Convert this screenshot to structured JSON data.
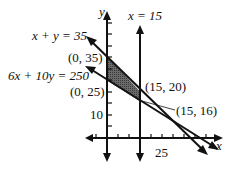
{
  "diagram": {
    "type": "linear-programming-feasible-region",
    "axes": {
      "x_label": "x",
      "y_label": "y",
      "x_tick_label": "25",
      "y_tick_label": "10"
    },
    "lines": [
      {
        "equation": "x + y = 35",
        "label": "x + y = 35"
      },
      {
        "equation": "6x + 10y = 250",
        "label": "6x + 10y = 250"
      },
      {
        "equation": "x = 15",
        "label": "x = 15"
      }
    ],
    "points": [
      {
        "coords": [
          0,
          35
        ],
        "label": "(0, 35)"
      },
      {
        "coords": [
          0,
          25
        ],
        "label": "(0, 25)"
      },
      {
        "coords": [
          15,
          20
        ],
        "label": "(15, 20)"
      },
      {
        "coords": [
          15,
          16
        ],
        "label": "(15, 16)"
      }
    ],
    "shaded_region": {
      "vertices": [
        "(0, 35)",
        "(0, 25)",
        "(15, 16)",
        "(15, 20)"
      ],
      "fill": "#555555"
    },
    "colors": {
      "ink": "#111111",
      "background": "#ffffff"
    }
  }
}
